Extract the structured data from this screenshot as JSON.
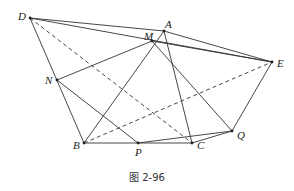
{
  "figure": {
    "caption": "图 2-96",
    "points": [
      {
        "name": "D",
        "label": "D"
      },
      {
        "name": "A",
        "label": "A"
      },
      {
        "name": "M",
        "label": "M"
      },
      {
        "name": "E",
        "label": "E"
      },
      {
        "name": "N",
        "label": "N"
      },
      {
        "name": "Q",
        "label": "Q"
      },
      {
        "name": "B",
        "label": "B"
      },
      {
        "name": "P",
        "label": "P"
      },
      {
        "name": "C",
        "label": "C"
      }
    ],
    "segments": [
      {
        "from": "D",
        "to": "A",
        "style": "solid"
      },
      {
        "from": "D",
        "to": "E",
        "style": "solid"
      },
      {
        "from": "D",
        "to": "B",
        "style": "solid"
      },
      {
        "from": "D",
        "to": "C",
        "style": "dashed"
      },
      {
        "from": "A",
        "to": "E",
        "style": "solid"
      },
      {
        "from": "M",
        "to": "E",
        "style": "solid"
      },
      {
        "from": "A",
        "to": "B",
        "style": "solid"
      },
      {
        "from": "A",
        "to": "C",
        "style": "solid"
      },
      {
        "from": "M",
        "to": "N",
        "style": "solid"
      },
      {
        "from": "M",
        "to": "Q",
        "style": "solid"
      },
      {
        "from": "N",
        "to": "P",
        "style": "solid"
      },
      {
        "from": "P",
        "to": "Q",
        "style": "solid"
      },
      {
        "from": "B",
        "to": "C",
        "style": "solid"
      },
      {
        "from": "C",
        "to": "Q",
        "style": "solid"
      },
      {
        "from": "Q",
        "to": "E",
        "style": "solid"
      },
      {
        "from": "B",
        "to": "E",
        "style": "dashed"
      }
    ]
  }
}
